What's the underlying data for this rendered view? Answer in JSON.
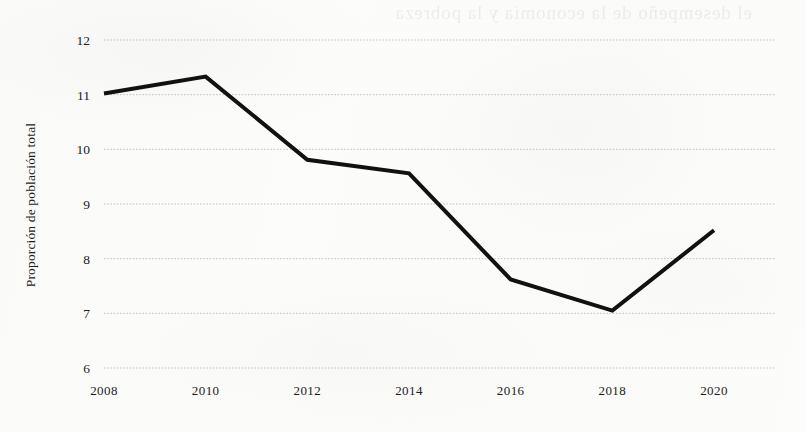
{
  "figure": {
    "background_color": "#fcfcfb",
    "ink_color": "#111111",
    "gridline_color": "#b9b9b9",
    "bleed_through_text": "el desempeño de la economía y la pobreza"
  },
  "axes": {
    "y_title": "Proporción de población total",
    "x_title": "",
    "y_ticks": [
      "12",
      "11",
      "10",
      "9",
      "8",
      "7",
      "6"
    ],
    "x_ticks": [
      "2008",
      "2010",
      "2012",
      "2014",
      "2016",
      "2018",
      "2020"
    ]
  },
  "chart_data": {
    "type": "line",
    "title": "",
    "xlabel": "",
    "ylabel": "Proporción de población total",
    "x": [
      2008,
      2010,
      2012,
      2014,
      2016,
      2018,
      2020
    ],
    "values": [
      11.02,
      11.33,
      9.81,
      9.56,
      7.62,
      7.05,
      8.52
    ],
    "series": [
      {
        "name": "Proporción de población total",
        "values": [
          11.02,
          11.33,
          9.81,
          9.56,
          7.62,
          7.05,
          8.52
        ],
        "color": "#111111",
        "line_width": 4
      }
    ],
    "xlim": [
      2008,
      2021.2
    ],
    "ylim": [
      6,
      12
    ],
    "y_tick_values": [
      12,
      11,
      10,
      9,
      8,
      7,
      6
    ],
    "x_tick_values": [
      2008,
      2010,
      2012,
      2014,
      2016,
      2018,
      2020
    ],
    "grid": true,
    "grid_axis": "y",
    "legend": false,
    "markers": false
  }
}
